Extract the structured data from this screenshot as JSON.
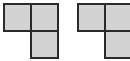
{
  "diagram": {
    "square_fill": "#d3d3d3",
    "square_border": "#2a2a2a",
    "figures": [
      {
        "name": "left-figure",
        "cells": [
          [
            0,
            0
          ],
          [
            1,
            0
          ],
          [
            1,
            1
          ]
        ]
      },
      {
        "name": "right-figure",
        "cells": [
          [
            0,
            0
          ],
          [
            1,
            0
          ],
          [
            1,
            1
          ]
        ]
      }
    ]
  }
}
